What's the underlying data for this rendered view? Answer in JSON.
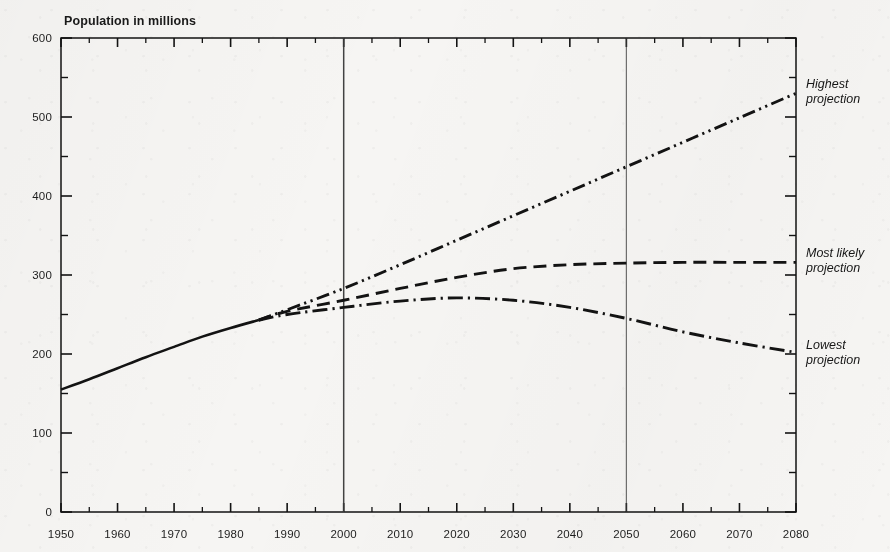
{
  "chart_title": "Population in millions",
  "axes": {
    "y_ticks": [
      0,
      100,
      200,
      300,
      400,
      500,
      600
    ],
    "y_minor_step": 50,
    "x_ticks": [
      1950,
      1960,
      1970,
      1980,
      1990,
      2000,
      2010,
      2020,
      2030,
      2040,
      2050,
      2060,
      2070,
      2080
    ],
    "x_minor_step": 5
  },
  "series_labels": {
    "highest_line1": "Highest",
    "highest_line2": "projection",
    "most_likely_line1": "Most likely",
    "most_likely_line2": "projection",
    "lowest_line1": "Lowest",
    "lowest_line2": "projection"
  },
  "colors": {
    "ink": "#151515",
    "paper": "#f4f3f1",
    "gridline": "#3a3a3a"
  },
  "chart_data": {
    "type": "line",
    "title": "Population in millions",
    "xlabel": "",
    "ylabel": "Population in millions",
    "xlim": [
      1950,
      2080
    ],
    "ylim": [
      0,
      600
    ],
    "grid": "vertical-markers-only",
    "gridlines_x": [
      2000,
      2050
    ],
    "legend_position": "right-inline-annotations",
    "series": [
      {
        "name": "Historical",
        "style": "solid",
        "x": [
          1950,
          1955,
          1960,
          1965,
          1970,
          1975,
          1980,
          1985
        ],
        "values": [
          155,
          168,
          182,
          196,
          209,
          222,
          233,
          243
        ]
      },
      {
        "name": "Highest projection",
        "style": "dash-dot-dot",
        "x": [
          1985,
          1990,
          2000,
          2010,
          2020,
          2030,
          2040,
          2050,
          2060,
          2070,
          2080
        ],
        "values": [
          243,
          256,
          283,
          313,
          344,
          375,
          406,
          437,
          468,
          499,
          530
        ]
      },
      {
        "name": "Most likely projection",
        "style": "dashed",
        "x": [
          1985,
          1990,
          2000,
          2010,
          2020,
          2030,
          2040,
          2050,
          2060,
          2070,
          2080
        ],
        "values": [
          243,
          254,
          268,
          283,
          297,
          308,
          313,
          315,
          316,
          316,
          316
        ]
      },
      {
        "name": "Lowest projection",
        "style": "dash-dot",
        "x": [
          1985,
          1990,
          2000,
          2010,
          2020,
          2030,
          2040,
          2050,
          2060,
          2070,
          2080
        ],
        "values": [
          243,
          250,
          259,
          267,
          271,
          268,
          259,
          245,
          228,
          214,
          202
        ]
      }
    ]
  }
}
